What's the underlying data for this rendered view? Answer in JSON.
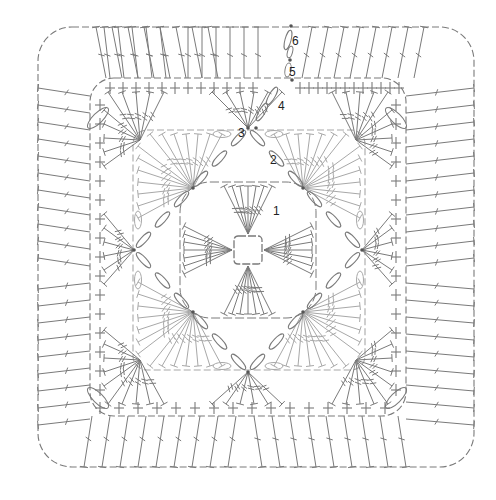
{
  "diagram": {
    "type": "crochet-chart",
    "center": [
      248,
      250
    ],
    "stroke_color": "#7a7a7a",
    "light_stroke_color": "#a8a8a8",
    "dot_color": "#555555",
    "round_labels": [
      {
        "text": "1",
        "x": 273,
        "y": 205
      },
      {
        "text": "2",
        "x": 270,
        "y": 154
      },
      {
        "text": "3",
        "x": 238,
        "y": 127
      },
      {
        "text": "4",
        "x": 278,
        "y": 100
      },
      {
        "text": "5",
        "x": 289,
        "y": 66
      },
      {
        "text": "6",
        "x": 292,
        "y": 35
      }
    ],
    "rounds": [
      {
        "round": 1,
        "shape": "center ring chain square",
        "half": 14
      },
      {
        "round": 2,
        "shape": "diamond with double-crochet fans",
        "half": 115
      },
      {
        "round": 3,
        "shape": "square with fans at corners",
        "half": 116
      },
      {
        "round": 4,
        "shape": "rounded square of fans",
        "half": 158
      },
      {
        "round": 5,
        "shape": "single crochet border",
        "half": 175
      },
      {
        "round": 6,
        "shape": "outer double-crochet border",
        "half": 218
      }
    ]
  }
}
